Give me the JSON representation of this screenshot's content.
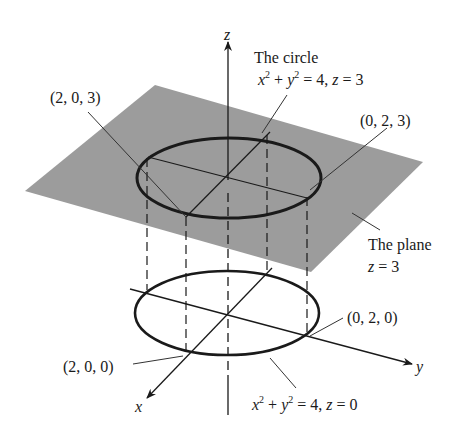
{
  "diagram": {
    "type": "3d-surface-illustration",
    "axes": {
      "x_label": "x",
      "y_label": "y",
      "z_label": "z"
    },
    "plane": {
      "label_line1": "The plane",
      "label_line2_var": "z",
      "label_line2_rest": " = 3",
      "color": "#9a9a9a"
    },
    "upper_circle": {
      "title": "The circle",
      "eq_x": "x",
      "eq_y": "y",
      "eq_exp": "2",
      "eq_rest1": " + ",
      "eq_rest2": " = 4,  ",
      "eq_z": "z",
      "eq_rest3": " = 3"
    },
    "lower_circle": {
      "eq_x": "x",
      "eq_y": "y",
      "eq_exp": "2",
      "eq_rest1": " + ",
      "eq_rest2": " = 4, ",
      "eq_z": "z",
      "eq_rest3": " = 0"
    },
    "points": {
      "p203": "(2, 0, 3)",
      "p023": "(0, 2, 3)",
      "p020": "(0, 2, 0)",
      "p200": "(2, 0, 0)"
    },
    "colors": {
      "line": "#1a1a1a",
      "plane": "#9a9a9a"
    }
  }
}
